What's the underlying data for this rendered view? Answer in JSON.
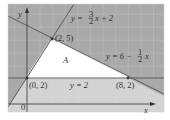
{
  "figure": {
    "type": "linear-programming-region",
    "axes": {
      "x_label": "x",
      "y_label": "y",
      "origin_label": "0"
    },
    "lines": [
      {
        "equation": "y = 3/2 x + 2",
        "label_prefix": "y = ",
        "num": "3",
        "den": "2",
        "label_suffix": "x + 2"
      },
      {
        "equation": "y = 6 - 1/2 x",
        "label_prefix": "y = 6 − ",
        "num": "1",
        "den": "2",
        "label_suffix": "x"
      },
      {
        "equation": "y = 2",
        "label": "y = 2"
      }
    ],
    "points": [
      {
        "label": "(2, 5)"
      },
      {
        "label": "(0, 2)"
      },
      {
        "label": "(8, 2)"
      }
    ],
    "region_label": "A",
    "colors": {
      "shade": "#a9a9a9",
      "grid": "#d0d0d0",
      "background": "#ececec",
      "line": "#555555",
      "region": "#ffffff"
    }
  }
}
